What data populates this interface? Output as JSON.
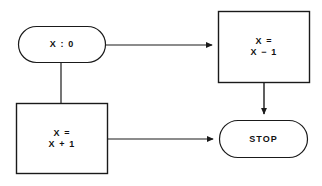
{
  "diagram": {
    "background_color": "#ffffff",
    "stroke_color": "#1a1a1a",
    "text_color": "#111111",
    "nodes": [
      {
        "id": "start",
        "shape": "stadium",
        "name": "node-set-x-zero",
        "lines": [
          "X : 0"
        ],
        "x": 18,
        "y": 26,
        "w": 88,
        "h": 37
      },
      {
        "id": "decrement",
        "shape": "rectangle",
        "name": "node-x-equals-x-minus-1",
        "lines": [
          "X =",
          "X − 1"
        ],
        "x": 218,
        "y": 11,
        "w": 92,
        "h": 72
      },
      {
        "id": "increment",
        "shape": "rectangle",
        "name": "node-x-equals-x-plus-1",
        "lines": [
          "X =",
          "X + 1"
        ],
        "x": 16,
        "y": 103,
        "w": 92,
        "h": 71
      },
      {
        "id": "stop",
        "shape": "stadium",
        "name": "node-stop",
        "lines": [
          "STOP"
        ],
        "x": 219,
        "y": 120,
        "w": 89,
        "h": 38
      }
    ],
    "connectors": [
      {
        "id": "start-to-decrement",
        "name": "connector-start-to-decrement",
        "from": "start",
        "to": "decrement",
        "arrowhead": true,
        "path": "M 106 45 L 212 45"
      },
      {
        "id": "start-to-increment",
        "name": "connector-start-to-increment",
        "from": "start",
        "to": "increment",
        "arrowhead": false,
        "path": "M 61 63 L 61 103"
      },
      {
        "id": "decrement-to-stop",
        "name": "connector-decrement-to-stop",
        "from": "decrement",
        "to": "stop",
        "arrowhead": true,
        "path": "M 264 83 L 264 114"
      },
      {
        "id": "increment-to-stop",
        "name": "connector-increment-to-stop",
        "from": "increment",
        "to": "stop",
        "arrowhead": true,
        "path": "M 108 139 L 213 139"
      }
    ]
  }
}
